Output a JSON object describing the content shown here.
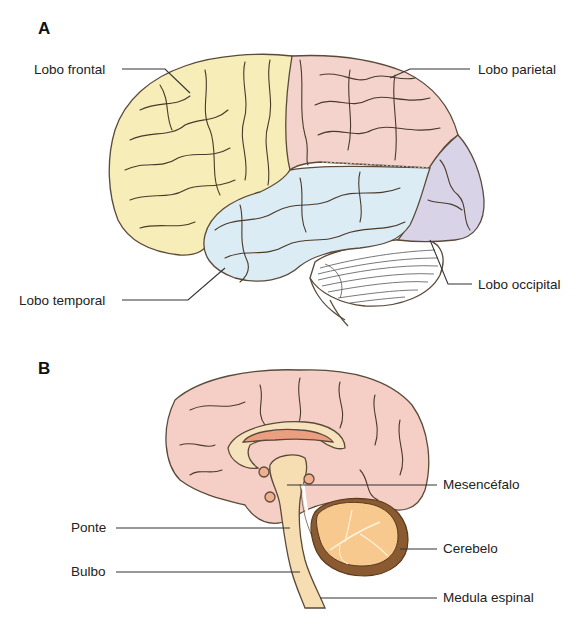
{
  "panels": [
    {
      "letter": "A",
      "view": "lateral",
      "labels": [
        {
          "id": "frontal",
          "text": "Lobo frontal",
          "x": 34,
          "y": 62,
          "align": "left"
        },
        {
          "id": "parietal",
          "text": "Lobo parietal",
          "x": 478,
          "y": 62,
          "align": "left"
        },
        {
          "id": "temporal",
          "text": "Lobo temporal",
          "x": 19,
          "y": 293,
          "align": "left"
        },
        {
          "id": "occipital",
          "text": "Lobo occipital",
          "x": 478,
          "y": 277,
          "align": "left"
        }
      ]
    },
    {
      "letter": "B",
      "view": "sagittal",
      "labels": [
        {
          "id": "mesencefalo",
          "text": "Mesencéfalo",
          "x": 443,
          "y": 477,
          "align": "left"
        },
        {
          "id": "ponte",
          "text": "Ponte",
          "x": 71,
          "y": 520,
          "align": "left"
        },
        {
          "id": "cerebelo",
          "text": "Cerebelo",
          "x": 443,
          "y": 541,
          "align": "left"
        },
        {
          "id": "bulbo",
          "text": "Bulbo",
          "x": 71,
          "y": 564,
          "align": "left"
        },
        {
          "id": "medula",
          "text": "Medula espinal",
          "x": 443,
          "y": 590,
          "align": "left"
        }
      ]
    }
  ],
  "colors": {
    "frontal": "#f7edb8",
    "parietal": "#f4d3cc",
    "temporal": "#dcecf5",
    "occipital": "#d9d3e8",
    "cerebellum_lateral": "#ffffff",
    "cortex_medial": "#f5cfc6",
    "corpus_callosum": "#f6e3bd",
    "ventricle": "#ec9e80",
    "brainstem": "#f6ddb2",
    "cerebellum_medial": "#f7c98f",
    "cerebellum_rim": "#8a5a30",
    "leader": "#333333",
    "sulcus": "#4a3a2a"
  }
}
